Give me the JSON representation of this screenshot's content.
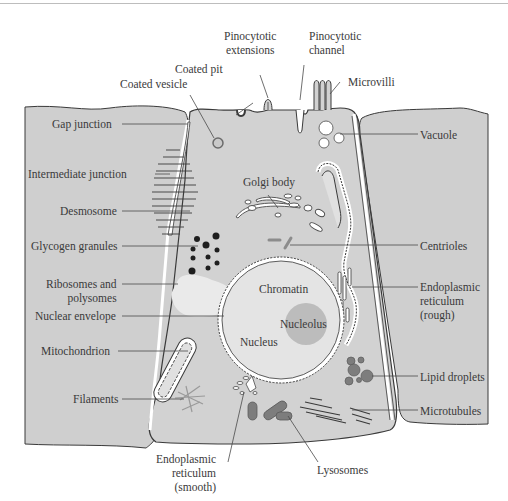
{
  "figure": {
    "colors": {
      "cytoplasm": "#cfcfcf",
      "nucleus": "#e4e4e4",
      "nucleolus": "#b9b9b9",
      "organelle_dark": "#7d7d7d",
      "outline": "#3a3a3a",
      "label_text": "#3a3a3a",
      "ribosome_patch": "#e8e8e8"
    },
    "labels": {
      "pinocytotic_extensions": [
        "Pinocytotic",
        "extensions"
      ],
      "pinocytotic_channel": [
        "Pinocytotic",
        "channel"
      ],
      "coated_pit": "Coated pit",
      "coated_vesicle": "Coated vesicle",
      "microvilli": "Microvilli",
      "gap_junction": "Gap junction",
      "vacuole": "Vacuole",
      "intermediate_junction": "Intermediate junction",
      "golgi_body": "Golgi body",
      "desmosome": "Desmosome",
      "glycogen_granules": "Glycogen granules",
      "centrioles": "Centrioles",
      "ribosomes_and_polysomes": [
        "Ribosomes and",
        "polysomes"
      ],
      "chromatin": "Chromatin",
      "endoplasmic_reticulum_rough": [
        "Endoplasmic",
        "reticulum",
        "(rough)"
      ],
      "nuclear_envelope": "Nuclear envelope",
      "nucleolus": "Nucleolus",
      "nucleus": "Nucleus",
      "mitochondrion": "Mitochondrion",
      "lipid_droplets": "Lipid droplets",
      "filaments": "Filaments",
      "microtubules": "Microtubules",
      "endoplasmic_reticulum_smooth": [
        "Endoplasmic",
        "reticulum",
        "(smooth)"
      ],
      "lysosomes": "Lysosomes"
    }
  }
}
